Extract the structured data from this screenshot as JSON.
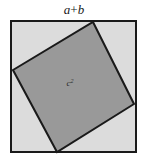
{
  "figure": {
    "name": "pythagorean-square-diagram",
    "top_label": {
      "full": "a+b",
      "term_a": "a",
      "operator": "+",
      "term_b": "b"
    },
    "inner_label": {
      "full": "c2",
      "base": "c",
      "exponent": "2"
    },
    "colors": {
      "page_background": "#ffffff",
      "outer_square_fill": "#dcdcdc",
      "inner_square_fill": "#999999",
      "stroke": "#1a1a1a",
      "label_text": "#1a1a1a",
      "inner_label_text": "#2b2b2b"
    },
    "geometry": {
      "outer_square": {
        "x": 11,
        "y": 21,
        "width": 125,
        "height": 131,
        "stroke_width": 2
      },
      "inner_square_points": "93,22 134,104 57,152 13,70",
      "inner_square_stroke_width": 2,
      "inner_label_position": {
        "x": 70,
        "y": 86
      }
    }
  }
}
